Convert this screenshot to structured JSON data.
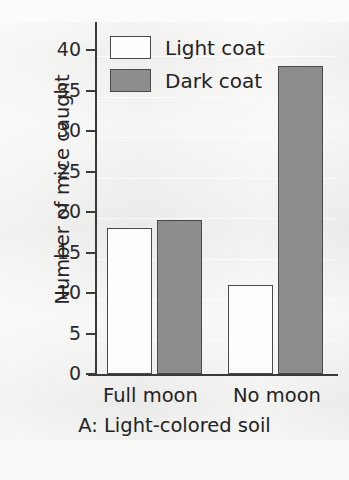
{
  "chart_data": {
    "type": "bar",
    "title": "",
    "caption": "A: Light-colored soil",
    "xlabel": "",
    "ylabel": "Number of mice caught",
    "categories": [
      "Full moon",
      "No moon"
    ],
    "series": [
      {
        "name": "Light coat",
        "values": [
          18,
          11
        ],
        "color": "#fdfdfc"
      },
      {
        "name": "Dark coat",
        "values": [
          19,
          38
        ],
        "color": "#8d8d8d"
      }
    ],
    "ylim": [
      0,
      40
    ],
    "yticks": [
      40,
      35,
      30,
      25,
      20,
      15,
      10,
      5,
      0
    ],
    "grid": true,
    "legend_position": "top-left"
  },
  "axis": {
    "y_title": "Number of mice caught",
    "tick_labels": [
      "40",
      "35",
      "30",
      "25",
      "20",
      "15",
      "10",
      "5",
      "0"
    ]
  },
  "legend": {
    "items": [
      {
        "label": "Light coat",
        "swatch": "light"
      },
      {
        "label": "Dark coat",
        "swatch": "dark"
      }
    ]
  },
  "categories": {
    "items": [
      "Full moon",
      "No moon"
    ]
  },
  "caption": {
    "text": "A: Light-colored soil"
  },
  "colors": {
    "light_coat": "#fdfdfc",
    "dark_coat": "#8d8d8d",
    "axis": "#3a3a3a",
    "background": "#f2f2f0"
  }
}
